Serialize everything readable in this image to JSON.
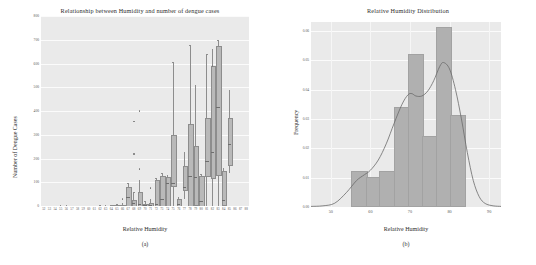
{
  "figure": {
    "panel_a_caption": "(a)",
    "panel_b_caption": "(b)"
  },
  "chart_data": [
    {
      "type": "bar",
      "subtype": "boxplot",
      "panel": "(a)",
      "title": "Relationship between Humidity and number of dengue cases",
      "xlabel": "Relative Humidity",
      "ylabel": "Number of Dengue Cases",
      "ylim": [
        0,
        800
      ],
      "yticks": [
        0,
        100,
        200,
        300,
        400,
        500,
        600,
        700,
        800
      ],
      "ytick_labels": [
        "0",
        "100",
        "200",
        "300",
        "400",
        "500",
        "600",
        "700",
        "800"
      ],
      "grid": true,
      "legend": "none",
      "categories": [
        "52",
        "53",
        "54",
        "55",
        "56",
        "57",
        "58",
        "59",
        "60",
        "61",
        "62",
        "63",
        "64",
        "65",
        "66",
        "67",
        "68",
        "69",
        "70",
        "71",
        "72",
        "73",
        "74",
        "75",
        "76",
        "77",
        "78",
        "79",
        "80",
        "81",
        "82",
        "83",
        "84",
        "85",
        "86",
        "87",
        "88"
      ],
      "boxes": [
        {
          "x": "52",
          "q1": 0,
          "median": 0,
          "q3": 0,
          "low": 0,
          "high": 0,
          "fliers": []
        },
        {
          "x": "53",
          "q1": 0,
          "median": 0,
          "q3": 0,
          "low": 0,
          "high": 0,
          "fliers": []
        },
        {
          "x": "54",
          "q1": 0,
          "median": 0,
          "q3": 1,
          "low": 0,
          "high": 2,
          "fliers": []
        },
        {
          "x": "55",
          "q1": 0,
          "median": 1,
          "q3": 2,
          "low": 0,
          "high": 3,
          "fliers": []
        },
        {
          "x": "56",
          "q1": 0,
          "median": 1,
          "q3": 2,
          "low": 0,
          "high": 4,
          "fliers": []
        },
        {
          "x": "57",
          "q1": 0,
          "median": 0,
          "q3": 1,
          "low": 0,
          "high": 2,
          "fliers": []
        },
        {
          "x": "58",
          "q1": 0,
          "median": 0,
          "q3": 1,
          "low": 0,
          "high": 2,
          "fliers": []
        },
        {
          "x": "59",
          "q1": 0,
          "median": 0,
          "q3": 1,
          "low": 0,
          "high": 2,
          "fliers": []
        },
        {
          "x": "60",
          "q1": 0,
          "median": 0,
          "q3": 1,
          "low": 0,
          "high": 2,
          "fliers": []
        },
        {
          "x": "61",
          "q1": 0,
          "median": 0,
          "q3": 1,
          "low": 0,
          "high": 2,
          "fliers": []
        },
        {
          "x": "62",
          "q1": 0,
          "median": 0,
          "q3": 2,
          "low": 0,
          "high": 4,
          "fliers": []
        },
        {
          "x": "63",
          "q1": 0,
          "median": 0,
          "q3": 2,
          "low": 0,
          "high": 4,
          "fliers": []
        },
        {
          "x": "64",
          "q1": 0,
          "median": 1,
          "q3": 3,
          "low": 0,
          "high": 6,
          "fliers": []
        },
        {
          "x": "65",
          "q1": 0,
          "median": 2,
          "q3": 5,
          "low": 0,
          "high": 10,
          "fliers": []
        },
        {
          "x": "66",
          "q1": 0,
          "median": 2,
          "q3": 6,
          "low": 0,
          "high": 12,
          "fliers": [
            30
          ]
        },
        {
          "x": "67",
          "q1": 2,
          "median": 40,
          "q3": 82,
          "low": 0,
          "high": 96,
          "fliers": []
        },
        {
          "x": "68",
          "q1": 4,
          "median": 12,
          "q3": 26,
          "low": 0,
          "high": 60,
          "fliers": [
            220,
            355
          ]
        },
        {
          "x": "69",
          "q1": 2,
          "median": 10,
          "q3": 60,
          "low": 0,
          "high": 108,
          "fliers": [
            155,
            400
          ]
        },
        {
          "x": "70",
          "q1": 0,
          "median": 4,
          "q3": 10,
          "low": 0,
          "high": 20,
          "fliers": []
        },
        {
          "x": "71",
          "q1": 0,
          "median": 6,
          "q3": 14,
          "low": 0,
          "high": 28,
          "fliers": [
            75
          ]
        },
        {
          "x": "72",
          "q1": 2,
          "median": 8,
          "q3": 110,
          "low": 0,
          "high": 120,
          "fliers": []
        },
        {
          "x": "73",
          "q1": 4,
          "median": 30,
          "q3": 126,
          "low": 0,
          "high": 140,
          "fliers": []
        },
        {
          "x": "74",
          "q1": 6,
          "median": 98,
          "q3": 122,
          "low": 0,
          "high": 130,
          "fliers": []
        },
        {
          "x": "75",
          "q1": 88,
          "median": 96,
          "q3": 298,
          "low": 0,
          "high": 605,
          "fliers": []
        },
        {
          "x": "76",
          "q1": 2,
          "median": 10,
          "q3": 28,
          "low": 0,
          "high": 40,
          "fliers": []
        },
        {
          "x": "77",
          "q1": 70,
          "median": 80,
          "q3": 168,
          "low": 30,
          "high": 228,
          "fliers": []
        },
        {
          "x": "78",
          "q1": 6,
          "median": 126,
          "q3": 344,
          "low": 0,
          "high": 678,
          "fliers": []
        },
        {
          "x": "79",
          "q1": 8,
          "median": 122,
          "q3": 252,
          "low": 0,
          "high": 510,
          "fliers": []
        },
        {
          "x": "80",
          "q1": 4,
          "median": 20,
          "q3": 126,
          "low": 0,
          "high": 134,
          "fliers": []
        },
        {
          "x": "81",
          "q1": 130,
          "median": 190,
          "q3": 370,
          "low": 0,
          "high": 640,
          "fliers": []
        },
        {
          "x": "82",
          "q1": 124,
          "median": 226,
          "q3": 590,
          "low": 0,
          "high": 660,
          "fliers": [
            590
          ]
        },
        {
          "x": "83",
          "q1": 134,
          "median": 418,
          "q3": 672,
          "low": 0,
          "high": 700,
          "fliers": []
        },
        {
          "x": "84",
          "q1": 8,
          "median": 24,
          "q3": 146,
          "low": 0,
          "high": 160,
          "fliers": []
        },
        {
          "x": "85",
          "q1": 176,
          "median": 262,
          "q3": 370,
          "low": 140,
          "high": 490,
          "fliers": []
        },
        {
          "x": "86",
          "q1": 0,
          "median": 0,
          "q3": 0,
          "low": 0,
          "high": 0,
          "fliers": []
        },
        {
          "x": "87",
          "q1": 0,
          "median": 0,
          "q3": 0,
          "low": 0,
          "high": 0,
          "fliers": []
        },
        {
          "x": "88",
          "q1": 0,
          "median": 0,
          "q3": 0,
          "low": 0,
          "high": 0,
          "fliers": []
        }
      ]
    },
    {
      "type": "bar",
      "subtype": "histogram-with-kde",
      "panel": "(b)",
      "title": "Relative Humidity Distribution",
      "xlabel": "Relative Humidity",
      "ylabel": "Frequency",
      "xlim": [
        45,
        93
      ],
      "ylim": [
        0.0,
        0.063
      ],
      "xticks": [
        50,
        60,
        70,
        80,
        90
      ],
      "xtick_labels": [
        "50",
        "60",
        "70",
        "80",
        "90"
      ],
      "yticks": [
        0.0,
        0.01,
        0.02,
        0.03,
        0.04,
        0.05,
        0.06
      ],
      "ytick_labels": [
        "0.00",
        "0.01",
        "0.02",
        "0.03",
        "0.04",
        "0.05",
        "0.06"
      ],
      "grid": true,
      "legend": "none",
      "bin_edges": [
        55.2,
        58.8,
        62.3,
        65.9,
        69.4,
        73.0,
        76.5,
        80.1,
        83.6
      ],
      "bin_values": [
        0.0115,
        0.0097,
        0.0115,
        0.0335,
        0.0515,
        0.0235,
        0.0605,
        0.0305
      ],
      "kde_label": "kernel density estimate",
      "kde_points": [
        [
          45.0,
          0.0002
        ],
        [
          48.0,
          0.0004
        ],
        [
          51.0,
          0.0013
        ],
        [
          54.0,
          0.005
        ],
        [
          56.5,
          0.009
        ],
        [
          58.5,
          0.011
        ],
        [
          60.0,
          0.0125
        ],
        [
          62.0,
          0.016
        ],
        [
          64.0,
          0.0215
        ],
        [
          66.0,
          0.0285
        ],
        [
          68.0,
          0.035
        ],
        [
          69.5,
          0.0382
        ],
        [
          70.5,
          0.0386
        ],
        [
          71.5,
          0.0378
        ],
        [
          73.0,
          0.0378
        ],
        [
          74.5,
          0.0395
        ],
        [
          76.0,
          0.043
        ],
        [
          77.5,
          0.0478
        ],
        [
          78.5,
          0.0492
        ],
        [
          80.0,
          0.047
        ],
        [
          81.5,
          0.04
        ],
        [
          83.0,
          0.03
        ],
        [
          84.5,
          0.0185
        ],
        [
          86.0,
          0.009
        ],
        [
          87.5,
          0.0035
        ],
        [
          89.0,
          0.0012
        ],
        [
          91.0,
          0.0004
        ],
        [
          93.0,
          0.0002
        ]
      ]
    }
  ],
  "colors": {
    "plot_background": "#eaeaea",
    "grid": "#fbfbfb",
    "bar_fill": "#b0b0b0",
    "box_fill": "#b9b9b9",
    "line": "#6b6b6b",
    "text": "#2c2c2c"
  }
}
